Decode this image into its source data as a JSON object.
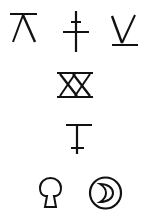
{
  "canvas": {
    "width": 148,
    "height": 221,
    "background": "#ffffff",
    "ink_color": "#111111"
  },
  "glyphs": [
    {
      "id": "glyph-1",
      "description": "Lambda-like shape with a horizontal bar on top",
      "icon": "lambda-with-top-bar-icon",
      "row": 1,
      "column": 1
    },
    {
      "id": "glyph-2",
      "description": "Vertical stroke crossed by a short upper bar and a longer lower bar",
      "icon": "double-cross-icon",
      "row": 1,
      "column": 2
    },
    {
      "id": "glyph-3",
      "description": "V shape with a horizontal underline",
      "icon": "v-with-underline-icon",
      "row": 1,
      "column": 3
    },
    {
      "id": "glyph-4",
      "description": "Two X shapes between top and bottom horizontal bars",
      "icon": "double-x-between-bars-icon",
      "row": 2,
      "column": 1
    },
    {
      "id": "glyph-5",
      "description": "Vertical stroke with a long top bar and a short lower crossbar",
      "icon": "i-beam-cross-icon",
      "row": 3,
      "column": 1
    },
    {
      "id": "glyph-6",
      "description": "Keyhole / mushroom outline shape",
      "icon": "keyhole-icon",
      "row": 4,
      "column": 1
    },
    {
      "id": "glyph-7",
      "description": "Crescent moon inside a circle",
      "icon": "circled-crescent-icon",
      "row": 4,
      "column": 2
    }
  ]
}
